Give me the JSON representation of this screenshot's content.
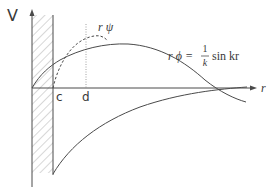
{
  "diagram": {
    "axes": {
      "y_label": "V",
      "x_label": "r"
    },
    "markers": {
      "c_label": "c",
      "d_label": "d"
    },
    "curves": {
      "interacting": {
        "label": "r ψ",
        "style": "dashed"
      },
      "free": {
        "label_lhs": "r ϕ =",
        "frac_num": "1",
        "frac_den": "k",
        "label_rhs": "sin kr",
        "style": "solid"
      },
      "potential": {
        "style": "solid"
      }
    },
    "wall": {
      "style": "hatched"
    },
    "colors": {
      "line": "#4a4a4a",
      "hatch": "#8a8a8a",
      "text": "#3a3a3a"
    }
  }
}
